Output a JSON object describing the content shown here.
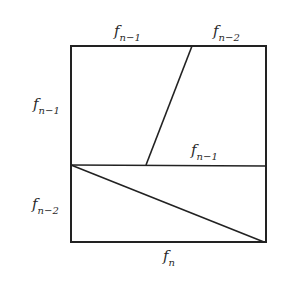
{
  "diagram": {
    "type": "geometric-dissection",
    "labels": {
      "top_left": {
        "base": "f",
        "sub": "n−1"
      },
      "top_right": {
        "base": "f",
        "sub": "n−2"
      },
      "left_upper": {
        "base": "f",
        "sub": "n−1"
      },
      "middle_right": {
        "base": "f",
        "sub": "n−1"
      },
      "left_lower": {
        "base": "f",
        "sub": "n−2"
      },
      "bottom": {
        "base": "f",
        "sub": "n"
      }
    },
    "line_color": "#222222"
  }
}
